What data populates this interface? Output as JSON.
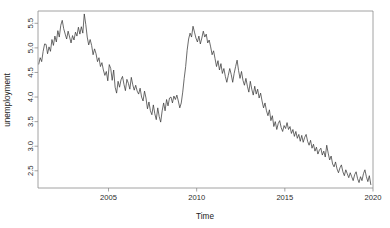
{
  "figure": {
    "background_color": "#ffffff",
    "line_color": "#3a3a3a",
    "axis_color": "#8c8c8c"
  },
  "chart_data": {
    "type": "line",
    "title": "",
    "subtitle": "",
    "xlabel": "Time",
    "ylabel": "unemployment",
    "xlim": [
      2001.0,
      2020.0
    ],
    "ylim": [
      2.15,
      5.75
    ],
    "grid": false,
    "legend": null,
    "xticks": [
      2005,
      2010,
      2015,
      2020
    ],
    "xtick_labels": [
      "2005",
      "2010",
      "2015",
      "2020"
    ],
    "yticks": [
      2.5,
      3.0,
      3.5,
      4.0,
      4.5,
      5.0,
      5.5
    ],
    "ytick_labels": [
      "2.5",
      "3.0",
      "3.5",
      "4.0",
      "4.5",
      "5.0",
      "5.5"
    ],
    "series": [
      {
        "name": "unemployment",
        "x": [
          2001.042,
          2001.125,
          2001.208,
          2001.292,
          2001.375,
          2001.458,
          2001.542,
          2001.625,
          2001.708,
          2001.792,
          2001.875,
          2001.958,
          2002.042,
          2002.125,
          2002.208,
          2002.292,
          2002.375,
          2002.458,
          2002.542,
          2002.625,
          2002.708,
          2002.792,
          2002.875,
          2002.958,
          2003.042,
          2003.125,
          2003.208,
          2003.292,
          2003.375,
          2003.458,
          2003.542,
          2003.625,
          2003.708,
          2003.792,
          2003.875,
          2003.958,
          2004.042,
          2004.125,
          2004.208,
          2004.292,
          2004.375,
          2004.458,
          2004.542,
          2004.625,
          2004.708,
          2004.792,
          2004.875,
          2004.958,
          2005.042,
          2005.125,
          2005.208,
          2005.292,
          2005.375,
          2005.458,
          2005.542,
          2005.625,
          2005.708,
          2005.792,
          2005.875,
          2005.958,
          2006.042,
          2006.125,
          2006.208,
          2006.292,
          2006.375,
          2006.458,
          2006.542,
          2006.625,
          2006.708,
          2006.792,
          2006.875,
          2006.958,
          2007.042,
          2007.125,
          2007.208,
          2007.292,
          2007.375,
          2007.458,
          2007.542,
          2007.625,
          2007.708,
          2007.792,
          2007.875,
          2007.958,
          2008.042,
          2008.125,
          2008.208,
          2008.292,
          2008.375,
          2008.458,
          2008.542,
          2008.625,
          2008.708,
          2008.792,
          2008.875,
          2008.958,
          2009.042,
          2009.125,
          2009.208,
          2009.292,
          2009.375,
          2009.458,
          2009.542,
          2009.625,
          2009.708,
          2009.792,
          2009.875,
          2009.958,
          2010.042,
          2010.125,
          2010.208,
          2010.292,
          2010.375,
          2010.458,
          2010.542,
          2010.625,
          2010.708,
          2010.792,
          2010.875,
          2010.958,
          2011.042,
          2011.125,
          2011.208,
          2011.292,
          2011.375,
          2011.458,
          2011.542,
          2011.625,
          2011.708,
          2011.792,
          2011.875,
          2011.958,
          2012.042,
          2012.125,
          2012.208,
          2012.292,
          2012.375,
          2012.458,
          2012.542,
          2012.625,
          2012.708,
          2012.792,
          2012.875,
          2012.958,
          2013.042,
          2013.125,
          2013.208,
          2013.292,
          2013.375,
          2013.458,
          2013.542,
          2013.625,
          2013.708,
          2013.792,
          2013.875,
          2013.958,
          2014.042,
          2014.125,
          2014.208,
          2014.292,
          2014.375,
          2014.458,
          2014.542,
          2014.625,
          2014.708,
          2014.792,
          2014.875,
          2014.958,
          2015.042,
          2015.125,
          2015.208,
          2015.292,
          2015.375,
          2015.458,
          2015.542,
          2015.625,
          2015.708,
          2015.792,
          2015.875,
          2015.958,
          2016.042,
          2016.125,
          2016.208,
          2016.292,
          2016.375,
          2016.458,
          2016.542,
          2016.625,
          2016.708,
          2016.792,
          2016.875,
          2016.958,
          2017.042,
          2017.125,
          2017.208,
          2017.292,
          2017.375,
          2017.458,
          2017.542,
          2017.625,
          2017.708,
          2017.792,
          2017.875,
          2017.958,
          2018.042,
          2018.125,
          2018.208,
          2018.292,
          2018.375,
          2018.458,
          2018.542,
          2018.625,
          2018.708,
          2018.792,
          2018.875,
          2018.958,
          2019.042,
          2019.125,
          2019.208,
          2019.292,
          2019.375,
          2019.458,
          2019.542,
          2019.625,
          2019.708,
          2019.792,
          2019.875
        ],
        "values": [
          4.67,
          4.8,
          4.72,
          4.93,
          5.08,
          5.07,
          4.88,
          5.02,
          4.93,
          5.17,
          5.05,
          5.24,
          5.12,
          5.35,
          5.22,
          5.46,
          5.56,
          5.39,
          5.28,
          5.18,
          5.34,
          5.22,
          5.1,
          5.25,
          5.16,
          5.32,
          5.24,
          5.42,
          5.28,
          5.43,
          5.3,
          5.69,
          5.48,
          5.22,
          5.06,
          5.17,
          5.05,
          4.86,
          4.98,
          4.88,
          4.72,
          4.8,
          4.62,
          4.7,
          4.55,
          4.44,
          4.52,
          4.33,
          4.66,
          4.58,
          4.34,
          4.55,
          4.2,
          4.08,
          4.32,
          4.2,
          4.35,
          4.42,
          4.26,
          4.13,
          4.36,
          4.28,
          4.16,
          4.4,
          4.25,
          4.14,
          4.24,
          4.12,
          4.06,
          4.18,
          4.0,
          3.92,
          4.12,
          3.98,
          3.76,
          3.9,
          3.72,
          3.64,
          3.84,
          3.66,
          3.54,
          3.78,
          3.6,
          3.49,
          3.72,
          3.88,
          3.72,
          3.95,
          3.82,
          3.98,
          4.0,
          3.88,
          4.02,
          3.95,
          4.04,
          3.92,
          3.78,
          3.88,
          4.1,
          4.38,
          4.62,
          4.95,
          5.18,
          5.3,
          5.22,
          5.44,
          5.32,
          5.2,
          5.12,
          5.24,
          5.08,
          5.2,
          5.34,
          5.22,
          5.28,
          5.1,
          5.16,
          5.02,
          4.86,
          4.94,
          4.78,
          4.62,
          4.74,
          4.55,
          4.68,
          4.48,
          4.58,
          4.42,
          4.3,
          4.44,
          4.58,
          4.46,
          4.3,
          4.48,
          4.62,
          4.75,
          4.54,
          4.38,
          4.52,
          4.34,
          4.24,
          4.38,
          4.22,
          4.1,
          4.32,
          4.16,
          4.04,
          4.22,
          4.06,
          4.16,
          3.98,
          4.08,
          3.92,
          3.78,
          3.88,
          3.72,
          3.62,
          3.74,
          3.52,
          3.62,
          3.4,
          3.5,
          3.34,
          3.46,
          3.52,
          3.38,
          3.3,
          3.42,
          3.36,
          3.48,
          3.34,
          3.4,
          3.26,
          3.34,
          3.2,
          3.3,
          3.16,
          3.24,
          3.1,
          3.22,
          3.08,
          3.18,
          3.24,
          3.1,
          3.02,
          3.12,
          2.96,
          3.04,
          2.9,
          2.98,
          2.84,
          2.92,
          2.96,
          2.82,
          2.9,
          2.78,
          3.02,
          2.86,
          2.72,
          2.8,
          2.64,
          2.58,
          2.68,
          2.54,
          2.46,
          2.56,
          2.62,
          2.48,
          2.4,
          2.52,
          2.44,
          2.36,
          2.46,
          2.38,
          2.3,
          2.42,
          2.48,
          2.34,
          2.26,
          2.38,
          2.3,
          2.44,
          2.52,
          2.38,
          2.28,
          2.4,
          2.22
        ]
      }
    ]
  }
}
